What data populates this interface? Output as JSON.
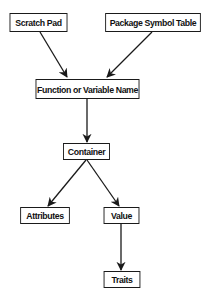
{
  "diagram": {
    "type": "flowchart",
    "nodes": [
      {
        "id": "scratch_pad",
        "label": "Scratch Pad"
      },
      {
        "id": "package_symbol_table",
        "label": "Package Symbol Table"
      },
      {
        "id": "function_or_variable_name",
        "label": "Function or Variable Name"
      },
      {
        "id": "container",
        "label": "Container"
      },
      {
        "id": "attributes",
        "label": "Attributes"
      },
      {
        "id": "value",
        "label": "Value"
      },
      {
        "id": "traits",
        "label": "Traits"
      }
    ],
    "edges": [
      {
        "from": "scratch_pad",
        "to": "function_or_variable_name"
      },
      {
        "from": "package_symbol_table",
        "to": "function_or_variable_name"
      },
      {
        "from": "function_or_variable_name",
        "to": "container"
      },
      {
        "from": "container",
        "to": "attributes"
      },
      {
        "from": "container",
        "to": "value"
      },
      {
        "from": "value",
        "to": "traits"
      }
    ],
    "colors": {
      "stroke": "#1a1a1a",
      "background": "#ffffff",
      "text": "#111111"
    }
  }
}
